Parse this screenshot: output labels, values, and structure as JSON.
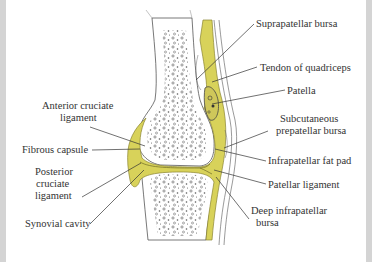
{
  "figure": {
    "colors": {
      "synovial_yellow": "#d8d25a",
      "yellow_dark": "#9c9430",
      "line": "#444444",
      "border": "#d4d4d4",
      "background": "#ffffff"
    },
    "labels_right": [
      {
        "id": "suprapatellar-bursa",
        "text": "Suprapatellar bursa"
      },
      {
        "id": "tendon-of-quadriceps",
        "text": "Tendon of quadriceps"
      },
      {
        "id": "patella",
        "text": "Patella"
      },
      {
        "id": "subcutaneous-prepatellar-bursa",
        "line1": "Subcutaneous",
        "line2": "prepatellar bursa"
      },
      {
        "id": "infrapatellar-fat-pad",
        "text": "Infrapatellar fat pad"
      },
      {
        "id": "patellar-ligament",
        "text": "Patellar ligament"
      },
      {
        "id": "deep-infrapatellar-bursa",
        "line1": "Deep infrapatellar",
        "line2": "bursa"
      }
    ],
    "labels_left": [
      {
        "id": "anterior-cruciate-ligament",
        "line1": "Anterior cruciate",
        "line2": "ligament"
      },
      {
        "id": "fibrous-capsule",
        "text": "Fibrous capsule"
      },
      {
        "id": "posterior-cruciate-ligament",
        "line1": "Posterior",
        "line2": "cruciate",
        "line3": "ligament"
      },
      {
        "id": "synovial-cavity",
        "text": "Synovial cavity"
      }
    ]
  }
}
